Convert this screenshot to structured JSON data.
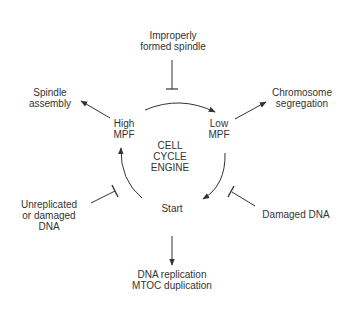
{
  "diagram": {
    "center_label": [
      "CELL",
      "CYCLE",
      "ENGINE"
    ],
    "states": {
      "high_mpf": [
        "High",
        "MPF"
      ],
      "low_mpf": [
        "Low",
        "MPF"
      ],
      "start": "Start"
    },
    "outputs": {
      "spindle_assembly": [
        "Spindle",
        "assembly"
      ],
      "chromosome_segregation": [
        "Chromosome",
        "segregation"
      ],
      "dna_replication": [
        "DNA replication",
        "MTOC duplication"
      ]
    },
    "inhibitors": {
      "improperly_formed_spindle": [
        "Improperly",
        "formed spindle"
      ],
      "unreplicated_dna": [
        "Unreplicated",
        "or damaged",
        "DNA"
      ],
      "damaged_dna": "Damaged DNA"
    },
    "colors": {
      "line": "#333333",
      "text": "#333333",
      "background": "#ffffff"
    }
  }
}
